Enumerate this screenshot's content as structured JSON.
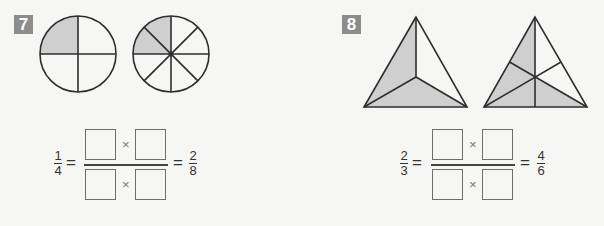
{
  "problems": [
    {
      "number": "7",
      "figures": [
        "circle divided into 4 equal parts, 1 shaded",
        "circle divided into 8 equal parts, 2 shaded"
      ],
      "equation": {
        "left": {
          "numerator": "1",
          "denominator": "4"
        },
        "equals": "=",
        "times": "×",
        "blanks": [
          "",
          "",
          "",
          ""
        ],
        "right": {
          "numerator": "2",
          "denominator": "8"
        }
      }
    },
    {
      "number": "8",
      "figures": [
        "triangle divided into 3 equal parts, 2 shaded",
        "triangle divided into 6 equal parts, 4 shaded"
      ],
      "equation": {
        "left": {
          "numerator": "2",
          "denominator": "3"
        },
        "equals": "=",
        "times": "×",
        "blanks": [
          "",
          "",
          "",
          ""
        ],
        "right": {
          "numerator": "4",
          "denominator": "6"
        }
      }
    }
  ],
  "colors": {
    "label_bg": "#8c8c8c",
    "shade": "#cfcfcf",
    "stroke": "#2e2e2e",
    "background": "#f6f6f5"
  }
}
